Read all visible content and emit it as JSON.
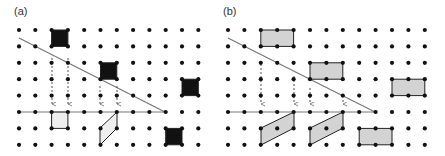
{
  "panels": [
    {
      "label": "(a)",
      "label_pos": [
        14,
        5
      ],
      "grid": {
        "x0": 19,
        "dx": 16.3,
        "cols": 12,
        "y0": 30,
        "dy": 16.4,
        "rows": 8
      },
      "diagonal": [
        [
          19,
          38
        ],
        [
          165,
          112
        ]
      ],
      "horizontal": [
        [
          19,
          112
        ],
        [
          165,
          112
        ]
      ],
      "arrows": [
        {
          "x": 52,
          "y1": 58,
          "y2": 104
        },
        {
          "x": 68,
          "y1": 58,
          "y2": 104
        },
        {
          "x": 100,
          "y1": 86,
          "y2": 104
        },
        {
          "x": 117,
          "y1": 86,
          "y2": 104
        }
      ],
      "filled_cells": [
        {
          "col": 2,
          "row": 0,
          "w": 1,
          "h": 1,
          "fill": "#111111"
        },
        {
          "col": 5,
          "row": 2,
          "w": 1,
          "h": 1,
          "fill": "#111111"
        },
        {
          "col": 10,
          "row": 3,
          "w": 1,
          "h": 1,
          "fill": "#111111"
        },
        {
          "col": 9,
          "row": 6,
          "w": 1,
          "h": 1,
          "fill": "#111111"
        },
        {
          "col": 2,
          "row": 5,
          "w": 1,
          "h": 1,
          "fill": "#eeeeee"
        }
      ],
      "parallelograms": [
        {
          "points": [
            [
              100,
              145
            ],
            [
              100,
              128
            ],
            [
              117,
              112
            ],
            [
              117,
              128
            ]
          ],
          "fill": "#eeeeee"
        }
      ]
    },
    {
      "label": "(b)",
      "label_pos": [
        223,
        5
      ],
      "grid": {
        "x0": 228,
        "dx": 16.4,
        "cols": 13,
        "y0": 30,
        "dy": 16.4,
        "rows": 8
      },
      "diagonal": [
        [
          228,
          38
        ],
        [
          375,
          112
        ]
      ],
      "horizontal": [
        [
          228,
          112
        ],
        [
          375,
          112
        ]
      ],
      "arrows": [
        {
          "x": 261,
          "y1": 64,
          "y2": 104
        },
        {
          "x": 294,
          "y1": 76,
          "y2": 104
        },
        {
          "x": 310,
          "y1": 88,
          "y2": 104
        },
        {
          "x": 343,
          "y1": 100,
          "y2": 104
        }
      ],
      "filled_cells": [
        {
          "col": 2,
          "row": 0,
          "w": 2,
          "h": 1,
          "fill": "#d3d3d3"
        },
        {
          "col": 5,
          "row": 2,
          "w": 2,
          "h": 1,
          "fill": "#d3d3d3"
        },
        {
          "col": 10,
          "row": 3,
          "w": 2,
          "h": 1,
          "fill": "#d3d3d3"
        },
        {
          "col": 8,
          "row": 6,
          "w": 2,
          "h": 1,
          "fill": "#d3d3d3"
        }
      ],
      "parallelograms": [
        {
          "points": [
            [
              261,
              145
            ],
            [
              261,
              128
            ],
            [
              294,
              112
            ],
            [
              294,
              128
            ]
          ],
          "fill": "#d3d3d3"
        },
        {
          "points": [
            [
              310,
              145
            ],
            [
              310,
              128
            ],
            [
              343,
              112
            ],
            [
              343,
              128
            ]
          ],
          "fill": "#d3d3d3"
        }
      ]
    }
  ],
  "colors": {
    "dot": "#111111",
    "line": "#777777",
    "arrow": "#555555",
    "outline": "#222222"
  }
}
